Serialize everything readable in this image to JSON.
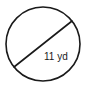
{
  "figure": {
    "kind": "circle-with-diameter",
    "alt_description": "Circle with a diameter segment labeled 11 yd",
    "background_color": "#ffffff",
    "stroke_color": "#1a1a1a",
    "stroke_width": 1.6,
    "canvas": {
      "width": 92,
      "height": 89
    }
  },
  "circle": {
    "center_x": 43,
    "center_y": 44,
    "radius": 37,
    "fill": "none"
  },
  "diameter": {
    "label": "11 yd",
    "value": 11,
    "unit": "yd",
    "x1": 14,
    "y1": 67,
    "x2": 72,
    "y2": 21
  },
  "label": {
    "text": "11 yd",
    "x": 44,
    "y": 60,
    "font_size": 10,
    "color": "#1a1a1a"
  }
}
